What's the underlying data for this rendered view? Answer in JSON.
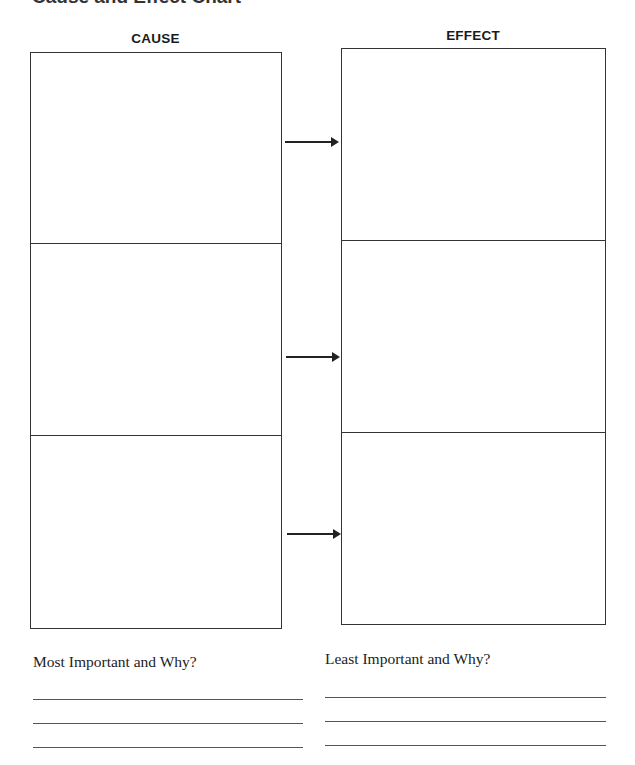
{
  "page": {
    "title": "Cause and Effect Chart"
  },
  "columns": {
    "cause_label": "CAUSE",
    "effect_label": "EFFECT"
  },
  "rows": [
    {
      "cause": "",
      "effect": ""
    },
    {
      "cause": "",
      "effect": ""
    },
    {
      "cause": "",
      "effect": ""
    }
  ],
  "reflection": {
    "most_important_label": "Most Important and Why?",
    "least_important_label": "Least Important and Why?",
    "most_important_lines": [
      "",
      "",
      ""
    ],
    "least_important_lines": [
      "",
      "",
      ""
    ]
  },
  "icons": {
    "arrow": "right-arrow-icon"
  }
}
